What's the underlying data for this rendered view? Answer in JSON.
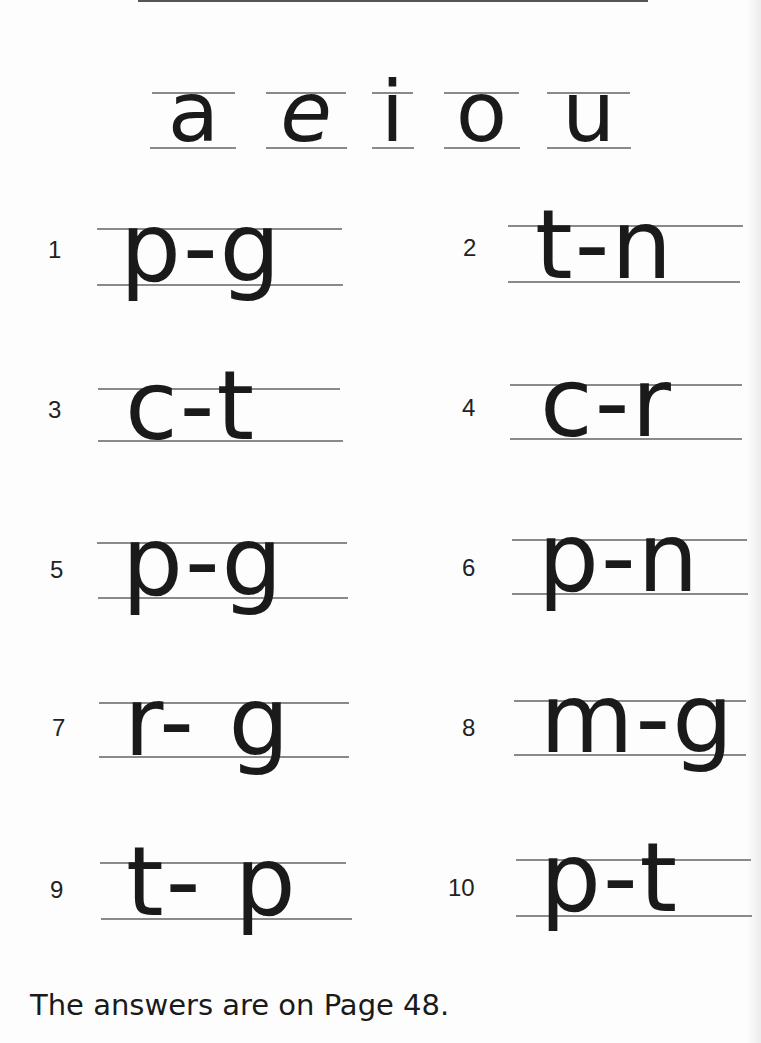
{
  "vowels": [
    "a",
    "e",
    "i",
    "o",
    "u"
  ],
  "exercises": [
    {
      "number": "1",
      "word": "p-g"
    },
    {
      "number": "2",
      "word": "t-n"
    },
    {
      "number": "3",
      "word": "c-t"
    },
    {
      "number": "4",
      "word": "c-r"
    },
    {
      "number": "5",
      "word": "p-g"
    },
    {
      "number": "6",
      "word": "p-n"
    },
    {
      "number": "7",
      "word": "r- g"
    },
    {
      "number": "8",
      "word": "m-g"
    },
    {
      "number": "9",
      "word": "t- p"
    },
    {
      "number": "10",
      "word": "p-t"
    }
  ],
  "footer": {
    "text": "The answers are on Page 48."
  },
  "colors": {
    "ink": "#1a1a1a",
    "guideline": "#8a8a8a",
    "paper": "#fdfdfd"
  }
}
